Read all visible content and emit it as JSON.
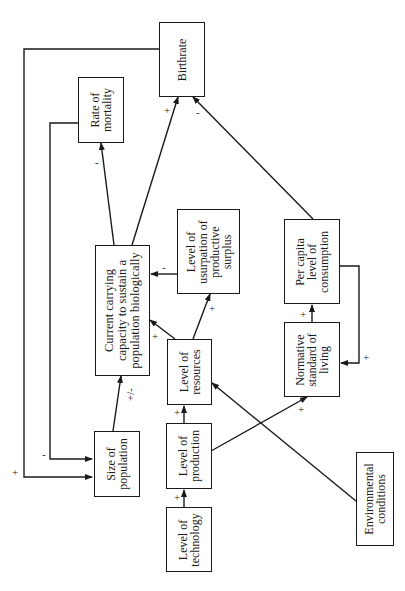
{
  "diagram": {
    "orientation": "rotated-90-ccw",
    "nodes": {
      "birthrate": "Birthrate",
      "mortality": "Rate of\nmortality",
      "capacity": "Current carrying\ncapacity to sustain a\npopulation biologically",
      "usurpation": "Level of\nusurpation of\nproductive\nsurplus",
      "consumption": "Per capita\nlevel of\nconsumption",
      "normative": "Normative\nstandard of\nliving",
      "resources": "Level of\nresources",
      "production": "Level of\nproduction",
      "technology": "Level of\ntechnology",
      "population": "Size of\npopulation",
      "environment": "Environmental\nconditions"
    },
    "edges": [
      {
        "from": "technology",
        "to": "production",
        "sign": "+"
      },
      {
        "from": "production",
        "to": "resources",
        "sign": "+"
      },
      {
        "from": "production",
        "to": "normative",
        "sign": "+"
      },
      {
        "from": "environment",
        "to": "resources",
        "sign": ""
      },
      {
        "from": "resources",
        "to": "capacity",
        "sign": "+"
      },
      {
        "from": "resources",
        "to": "usurpation",
        "sign": "+"
      },
      {
        "from": "usurpation",
        "to": "capacity",
        "sign": "-"
      },
      {
        "from": "normative",
        "to": "consumption",
        "sign": "+"
      },
      {
        "from": "consumption",
        "to": "normative",
        "sign": "+"
      },
      {
        "from": "consumption",
        "to": "birthrate",
        "sign": "-"
      },
      {
        "from": "capacity",
        "to": "birthrate",
        "sign": "+"
      },
      {
        "from": "capacity",
        "to": "mortality",
        "sign": "-"
      },
      {
        "from": "population",
        "to": "capacity",
        "sign": "+/-"
      },
      {
        "from": "mortality",
        "to": "population",
        "sign": "-"
      },
      {
        "from": "birthrate",
        "to": "population",
        "sign": "+"
      }
    ],
    "signs": {
      "tech_prod": "+",
      "prod_res": "+",
      "prod_norm": "+",
      "res_cap": "+",
      "res_usurp": "+",
      "usurp_cap": "-",
      "norm_cons": "+",
      "cons_norm": "+",
      "cons_birth": "-",
      "cap_birth": "+",
      "cap_mort": "-",
      "pop_cap": "+/-",
      "mort_pop": "-",
      "birth_pop": "+"
    }
  }
}
